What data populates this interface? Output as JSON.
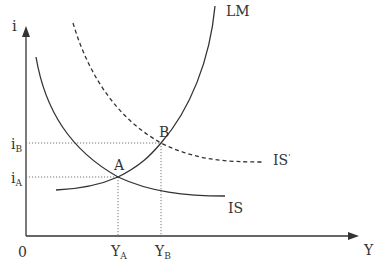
{
  "diagram": {
    "type": "IS-LM model",
    "axes": {
      "y_label": "i",
      "x_label": "Y",
      "origin_label": "0"
    },
    "curves": {
      "lm": {
        "label": "LM",
        "style": "solid"
      },
      "is": {
        "label": "IS",
        "style": "solid"
      },
      "is_shifted": {
        "label": "IS",
        "prime": "'",
        "style": "dashed"
      }
    },
    "points": {
      "a": {
        "label": "A"
      },
      "b": {
        "label": "B"
      }
    },
    "y_ticks": {
      "i_b": {
        "base": "i",
        "sub": "B"
      },
      "i_a": {
        "base": "i",
        "sub": "A"
      }
    },
    "x_ticks": {
      "y_a": {
        "base": "Y",
        "sub": "A"
      },
      "y_b": {
        "base": "Y",
        "sub": "B"
      }
    },
    "colors": {
      "line": "#333333",
      "guide": "#777777",
      "background": "#ffffff"
    }
  }
}
